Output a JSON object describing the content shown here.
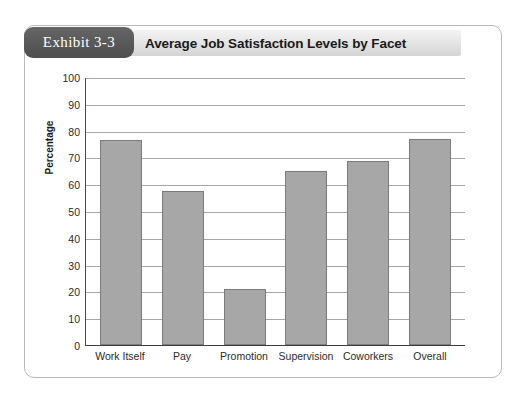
{
  "exhibit": {
    "badge_label": "Exhibit 3-3",
    "badge_color": "#585858",
    "title": "Average Job Satisfaction Levels by Facet",
    "header_band_color": "#e6e6e6",
    "frame_border_color": "#b9b9b9"
  },
  "chart_data": {
    "type": "bar",
    "title": "Average Job Satisfaction Levels by Facet",
    "categories": [
      "Work Itself",
      "Pay",
      "Promotion",
      "Supervision",
      "Coworkers",
      "Overall"
    ],
    "values": [
      76.5,
      57.5,
      21,
      65,
      68.5,
      77
    ],
    "xlabel": "",
    "ylabel": "Percentage",
    "ylim": [
      0,
      100
    ],
    "ytick_step": 10,
    "yticks": [
      100,
      90,
      80,
      70,
      60,
      50,
      40,
      30,
      20,
      10,
      0
    ],
    "grid": true,
    "grid_axis": "y",
    "legend": null,
    "bar_fill_color": "#a7a7a7",
    "bar_border_color": "#7b7b7b",
    "gridline_color": "#a6a6a6",
    "axis_color": "#3d3d3d"
  }
}
